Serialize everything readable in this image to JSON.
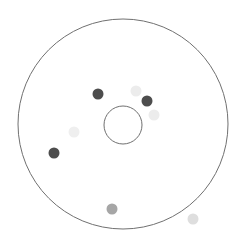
{
  "diagram": {
    "type": "radial-dot-plot",
    "outer_ring": {
      "cx": 123,
      "cy": 124,
      "r": 105,
      "stroke": "#707070"
    },
    "inner_ring": {
      "cx": 123,
      "cy": 125,
      "r": 19,
      "stroke": "#707070"
    },
    "dots": [
      {
        "cx": 98,
        "cy": 94,
        "r": 5.5,
        "fill": "#4d4d4d"
      },
      {
        "cx": 136,
        "cy": 91,
        "r": 5.5,
        "fill": "#ececec"
      },
      {
        "cx": 147,
        "cy": 101,
        "r": 5.5,
        "fill": "#4d4d4d"
      },
      {
        "cx": 154,
        "cy": 115,
        "r": 5.5,
        "fill": "#ececec"
      },
      {
        "cx": 74,
        "cy": 132,
        "r": 5.5,
        "fill": "#efefef"
      },
      {
        "cx": 54,
        "cy": 153,
        "r": 5.5,
        "fill": "#4d4d4d"
      },
      {
        "cx": 112,
        "cy": 209,
        "r": 5.5,
        "fill": "#a6a6a6"
      },
      {
        "cx": 193,
        "cy": 219,
        "r": 5.5,
        "fill": "#dedede"
      }
    ]
  }
}
